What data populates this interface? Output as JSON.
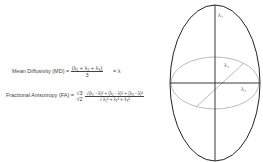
{
  "equations": {
    "md_label": "Mean Diffusivity (MD) =",
    "md_numerator": "(λ₁ + λ₂ + λ₃)",
    "md_denominator": "3",
    "md_result": "= λ",
    "fa_label": "Fractional Anisotropy (FA) =",
    "fa_coef_num": "√3",
    "fa_coef_den": "√2",
    "fa_numerator": "√(λ₁ - λ)² + (λ₂ - λ)² + (λ₃ - λ)²",
    "fa_denominator": "√ λ₁² + λ₂² + λ₃²"
  },
  "diagram": {
    "axis_labels": [
      "λ₁",
      "λ₂",
      "λ₃"
    ],
    "outer_ellipse_color": "#222222",
    "inner_ellipse_color": "#aaaaaa"
  }
}
